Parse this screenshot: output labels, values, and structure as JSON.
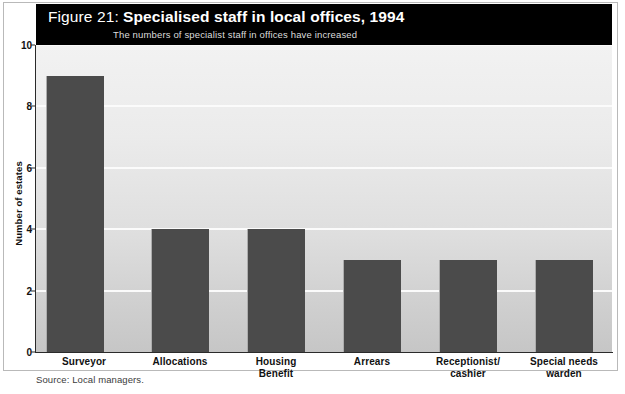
{
  "figure": {
    "number_label": "Figure 21:",
    "title": "Specialised staff in local offices, 1994",
    "subtitle": "The numbers of specialist staff in offices have increased",
    "source": "Source: Local managers."
  },
  "colors": {
    "band_background": "#000000",
    "bar_fill": "#4b4b4b",
    "gridline": "#fbfbfb",
    "plot_top": "#f2f2f2",
    "plot_bottom": "#c6c6c6",
    "axis": "#2a2a2a"
  },
  "chart_data": {
    "type": "bar",
    "title": "Figure 21: Specialised staff in local offices, 1994",
    "subtitle": "The numbers of specialist staff in offices have increased",
    "xlabel": "",
    "ylabel": "Number of estates",
    "ylim": [
      0,
      10
    ],
    "ytick_step": 2,
    "yticks": [
      0,
      2,
      4,
      6,
      8,
      10
    ],
    "ytick_labels": [
      "0",
      "2",
      "4",
      "6",
      "8",
      "10"
    ],
    "grid": "horizontal",
    "legend": "none",
    "orientation": "vertical",
    "categories": [
      "Surveyor",
      "Allocations",
      "Housing Benefit",
      "Arrears",
      "Receptionist/ cashier",
      "Special needs warden"
    ],
    "category_label_lines": [
      [
        "Surveyor"
      ],
      [
        "Allocations"
      ],
      [
        "Housing",
        "Benefit"
      ],
      [
        "Arrears"
      ],
      [
        "Receptionist/",
        "cashier"
      ],
      [
        "Special needs",
        "warden"
      ]
    ],
    "values": [
      9,
      4,
      4,
      3,
      3,
      3
    ],
    "series": [
      {
        "name": "Number of estates",
        "values": [
          9,
          4,
          4,
          3,
          3,
          3
        ]
      }
    ],
    "source": "Source: Local managers."
  }
}
